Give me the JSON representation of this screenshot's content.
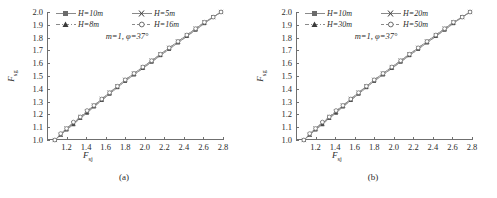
{
  "figure": {
    "panels": [
      {
        "caption": "(a)",
        "annotation": "m=1, φ=37°",
        "legend": [
          {
            "label": "H=10m",
            "marker": "filled-square",
            "linestyle": "solid"
          },
          {
            "label": "H=5m",
            "marker": "cross-x",
            "linestyle": "solid"
          },
          {
            "label": "H=8m",
            "marker": "filled-triangle",
            "linestyle": "dash-dot"
          },
          {
            "label": "H=16m",
            "marker": "open-circle",
            "linestyle": "dashed"
          }
        ]
      },
      {
        "caption": "(b)",
        "annotation": "m=1, φ=37°",
        "legend": [
          {
            "label": "H=10m",
            "marker": "filled-square",
            "linestyle": "solid"
          },
          {
            "label": "H=20m",
            "marker": "cross-x",
            "linestyle": "solid"
          },
          {
            "label": "H=30m",
            "marker": "filled-triangle",
            "linestyle": "dash-dot"
          },
          {
            "label": "H=50m",
            "marker": "open-circle",
            "linestyle": "dashed"
          }
        ]
      }
    ]
  },
  "chart_data": [
    {
      "type": "line",
      "title": "",
      "panel": "(a)",
      "xlabel": "F_sj",
      "ylabel": "F_sg",
      "xlabel_base": "F",
      "xlabel_sub": "sj",
      "ylabel_base": "F",
      "ylabel_sub": "sg",
      "xlim": [
        1.0,
        2.8
      ],
      "ylim": [
        1.0,
        2.0
      ],
      "xticks": [
        1.2,
        1.4,
        1.6,
        1.8,
        2.0,
        2.2,
        2.4,
        2.6,
        2.8
      ],
      "xtick_labels": [
        "1.2",
        "1.4",
        "1.6",
        "1.8",
        "2.0",
        "2.2",
        "2.4",
        "2.6",
        "2.8"
      ],
      "yticks": [
        1.0,
        1.1,
        1.2,
        1.3,
        1.4,
        1.5,
        1.6,
        1.7,
        1.8,
        1.9,
        2.0
      ],
      "ytick_labels": [
        "1.0",
        "1.1",
        "1.2",
        "1.3",
        "1.4",
        "1.5",
        "1.6",
        "1.7",
        "1.8",
        "1.9",
        "2.0"
      ],
      "grid": false,
      "legend_position": "upper-left",
      "annotation": "m=1, φ=37°",
      "x": [
        1.08,
        1.14,
        1.2,
        1.27,
        1.34,
        1.41,
        1.48,
        1.56,
        1.64,
        1.72,
        1.8,
        1.89,
        1.98,
        2.07,
        2.16,
        2.25,
        2.34,
        2.43,
        2.52,
        2.61,
        2.7,
        2.78
      ],
      "series": [
        {
          "name": "H=10m",
          "marker": "filled-square",
          "values": [
            1.0,
            1.04,
            1.08,
            1.13,
            1.17,
            1.22,
            1.26,
            1.31,
            1.36,
            1.41,
            1.46,
            1.51,
            1.56,
            1.61,
            1.66,
            1.71,
            1.76,
            1.81,
            1.86,
            1.91,
            1.96,
            2.0
          ]
        },
        {
          "name": "H=5m",
          "marker": "cross-x",
          "values": [
            1.0,
            1.04,
            1.09,
            1.13,
            1.18,
            1.22,
            1.27,
            1.32,
            1.37,
            1.42,
            1.47,
            1.52,
            1.57,
            1.62,
            1.67,
            1.72,
            1.77,
            1.82,
            1.87,
            1.92,
            1.96,
            2.0
          ]
        },
        {
          "name": "H=8m",
          "marker": "filled-triangle",
          "values": [
            1.0,
            1.04,
            1.08,
            1.12,
            1.17,
            1.21,
            1.26,
            1.31,
            1.36,
            1.41,
            1.46,
            1.51,
            1.56,
            1.61,
            1.66,
            1.71,
            1.76,
            1.81,
            1.86,
            1.91,
            1.96,
            2.0
          ]
        },
        {
          "name": "H=16m",
          "marker": "open-circle",
          "values": [
            1.0,
            1.05,
            1.09,
            1.14,
            1.18,
            1.23,
            1.27,
            1.32,
            1.37,
            1.42,
            1.47,
            1.52,
            1.57,
            1.62,
            1.67,
            1.72,
            1.77,
            1.82,
            1.87,
            1.92,
            1.96,
            2.0
          ]
        }
      ]
    },
    {
      "type": "line",
      "title": "",
      "panel": "(b)",
      "xlabel": "F_sj",
      "ylabel": "F_sg",
      "xlabel_base": "F",
      "xlabel_sub": "sj",
      "ylabel_base": "F",
      "ylabel_sub": "sg",
      "xlim": [
        1.0,
        2.8
      ],
      "ylim": [
        1.0,
        2.0
      ],
      "xticks": [
        1.2,
        1.4,
        1.6,
        1.8,
        2.0,
        2.2,
        2.4,
        2.6,
        2.8
      ],
      "xtick_labels": [
        "1.2",
        "1.4",
        "1.6",
        "1.8",
        "2.0",
        "2.2",
        "2.4",
        "2.6",
        "2.8"
      ],
      "yticks": [
        1.0,
        1.1,
        1.2,
        1.3,
        1.4,
        1.5,
        1.6,
        1.7,
        1.8,
        1.9,
        2.0
      ],
      "ytick_labels": [
        "1.0",
        "1.1",
        "1.2",
        "1.3",
        "1.4",
        "1.5",
        "1.6",
        "1.7",
        "1.8",
        "1.9",
        "2.0"
      ],
      "grid": false,
      "legend_position": "upper-left",
      "annotation": "m=1, φ=37°",
      "x": [
        1.08,
        1.14,
        1.2,
        1.27,
        1.34,
        1.41,
        1.48,
        1.56,
        1.64,
        1.72,
        1.8,
        1.89,
        1.98,
        2.07,
        2.16,
        2.25,
        2.34,
        2.43,
        2.52,
        2.61,
        2.7,
        2.78
      ],
      "series": [
        {
          "name": "H=10m",
          "marker": "filled-square",
          "values": [
            1.0,
            1.04,
            1.08,
            1.13,
            1.17,
            1.22,
            1.26,
            1.31,
            1.36,
            1.41,
            1.46,
            1.51,
            1.56,
            1.61,
            1.66,
            1.71,
            1.76,
            1.81,
            1.86,
            1.91,
            1.96,
            2.0
          ]
        },
        {
          "name": "H=20m",
          "marker": "cross-x",
          "values": [
            1.0,
            1.04,
            1.09,
            1.13,
            1.18,
            1.22,
            1.27,
            1.32,
            1.37,
            1.42,
            1.47,
            1.52,
            1.57,
            1.62,
            1.67,
            1.72,
            1.77,
            1.82,
            1.87,
            1.92,
            1.96,
            2.0
          ]
        },
        {
          "name": "H=30m",
          "marker": "filled-triangle",
          "values": [
            1.0,
            1.04,
            1.08,
            1.12,
            1.17,
            1.21,
            1.26,
            1.31,
            1.36,
            1.41,
            1.46,
            1.51,
            1.56,
            1.61,
            1.66,
            1.71,
            1.76,
            1.81,
            1.86,
            1.91,
            1.96,
            2.0
          ]
        },
        {
          "name": "H=50m",
          "marker": "open-circle",
          "values": [
            1.0,
            1.05,
            1.09,
            1.14,
            1.18,
            1.23,
            1.27,
            1.32,
            1.37,
            1.42,
            1.47,
            1.52,
            1.57,
            1.62,
            1.67,
            1.72,
            1.77,
            1.82,
            1.87,
            1.92,
            1.96,
            2.0
          ]
        }
      ]
    }
  ]
}
